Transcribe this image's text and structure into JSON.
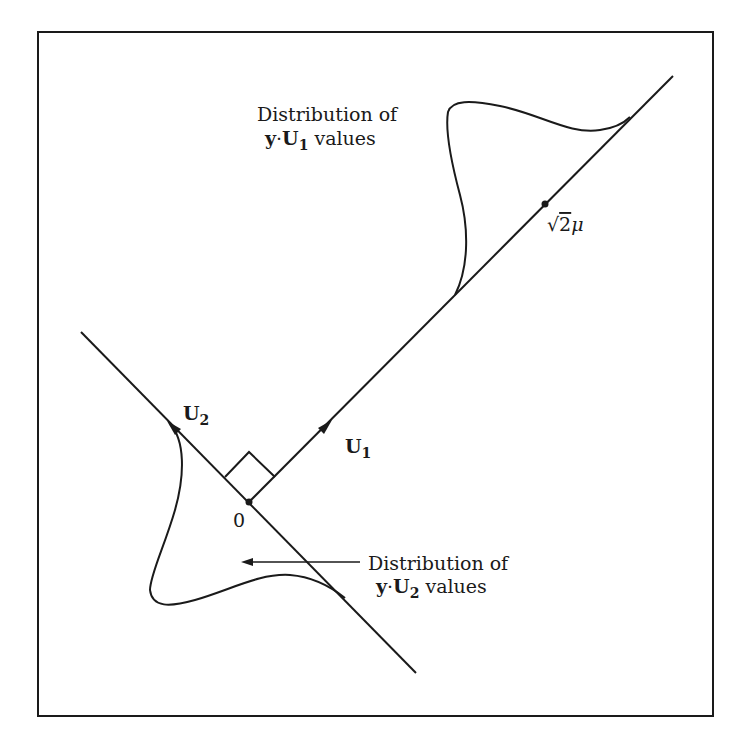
{
  "diagram": {
    "frame": {
      "x": 38,
      "y": 32,
      "width": 675,
      "height": 684
    },
    "stroke_color": "#1a1a1a",
    "axes": {
      "u1": {
        "label_main": "U",
        "label_sub": "1",
        "line": [
          [
            249,
            502
          ],
          [
            673,
            76
          ]
        ],
        "arrow_at": [
          329,
          423
        ]
      },
      "u2": {
        "label_main": "U",
        "label_sub": "2",
        "line": [
          [
            81,
            332
          ],
          [
            416,
            673
          ]
        ],
        "arrow_at": [
          170,
          424
        ]
      }
    },
    "origin": {
      "label": "0",
      "point": [
        249,
        502
      ]
    },
    "mean_point": {
      "label_prefix": "√",
      "label_radicand": "2",
      "label_mu": "μ",
      "point": [
        545,
        204
      ]
    },
    "annotations": {
      "upper": {
        "line1": "Distribution of",
        "line2_y": "y",
        "line2_dot": "·",
        "line2_U": "U",
        "line2_sub": "1",
        "line2_tail": "values"
      },
      "lower": {
        "line1": "Distribution of",
        "line2_y": "y",
        "line2_dot": "·",
        "line2_U": "U",
        "line2_sub": "2",
        "line2_tail": "values"
      }
    }
  }
}
